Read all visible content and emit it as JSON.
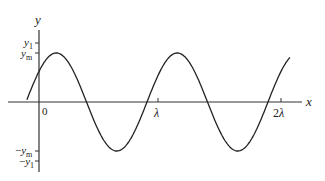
{
  "diagram": {
    "type": "sine-wave",
    "axes": {
      "x_label": "x",
      "y_label": "y",
      "origin_label": "0"
    },
    "x_ticks": [
      {
        "label": "λ",
        "value": 1
      },
      {
        "label": "2λ",
        "value": 2
      }
    ],
    "y_ticks": [
      {
        "label": "y1",
        "base": "y",
        "sub": "1",
        "sign": ""
      },
      {
        "label": "ym",
        "base": "y",
        "sub": "m",
        "sign": ""
      },
      {
        "label": "-ym",
        "base": "y",
        "sub": "m",
        "sign": "−"
      },
      {
        "label": "-y1",
        "base": "y",
        "sub": "1",
        "sign": "−"
      }
    ],
    "curve": {
      "amplitude_label": "ym",
      "wavelength_label": "λ",
      "x_range_wavelengths": [
        -0.1,
        2.08
      ]
    },
    "colors": {
      "line": "#222222",
      "background": "#ffffff"
    }
  }
}
